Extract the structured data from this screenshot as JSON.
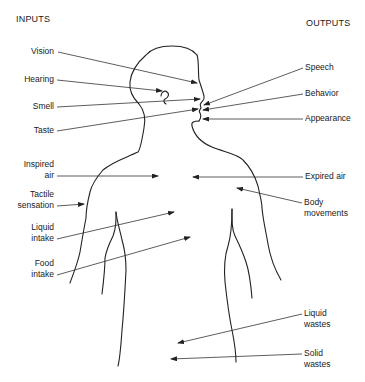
{
  "headings": {
    "inputs": "INPUTS",
    "outputs": "OUTPUTS"
  },
  "inputs": [
    {
      "id": "vision",
      "label_lines": [
        "Vision"
      ]
    },
    {
      "id": "hearing",
      "label_lines": [
        "Hearing"
      ]
    },
    {
      "id": "smell",
      "label_lines": [
        "Smell"
      ]
    },
    {
      "id": "taste",
      "label_lines": [
        "Taste"
      ]
    },
    {
      "id": "inspired-air",
      "label_lines": [
        "Inspired",
        "air"
      ]
    },
    {
      "id": "tactile-sensation",
      "label_lines": [
        "Tactile",
        "sensation"
      ]
    },
    {
      "id": "liquid-intake",
      "label_lines": [
        "Liquid",
        "intake"
      ]
    },
    {
      "id": "food-intake",
      "label_lines": [
        "Food",
        "intake"
      ]
    }
  ],
  "outputs": [
    {
      "id": "speech",
      "label_lines": [
        "Speech"
      ]
    },
    {
      "id": "behavior",
      "label_lines": [
        "Behavior"
      ]
    },
    {
      "id": "appearance",
      "label_lines": [
        "Appearance"
      ]
    },
    {
      "id": "expired-air",
      "label_lines": [
        "Expired air"
      ]
    },
    {
      "id": "body-movements",
      "label_lines": [
        "Body",
        "movements"
      ]
    },
    {
      "id": "liquid-wastes",
      "label_lines": [
        "Liquid",
        "wastes"
      ]
    },
    {
      "id": "solid-wastes",
      "label_lines": [
        "Solid",
        "wastes"
      ]
    }
  ]
}
